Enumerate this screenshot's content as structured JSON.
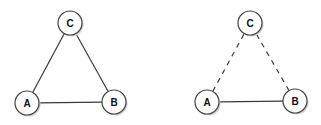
{
  "graphs": [
    {
      "name": "complete-triangle",
      "nodes": [
        {
          "id": "A",
          "label": "A"
        },
        {
          "id": "B",
          "label": "B"
        },
        {
          "id": "C",
          "label": "C"
        }
      ],
      "edges": [
        {
          "from": "A",
          "to": "B",
          "style": "solid"
        },
        {
          "from": "A",
          "to": "C",
          "style": "solid"
        },
        {
          "from": "B",
          "to": "C",
          "style": "solid"
        }
      ]
    },
    {
      "name": "partial-triangle",
      "nodes": [
        {
          "id": "A",
          "label": "A"
        },
        {
          "id": "B",
          "label": "B"
        },
        {
          "id": "C",
          "label": "C"
        }
      ],
      "edges": [
        {
          "from": "A",
          "to": "B",
          "style": "solid"
        },
        {
          "from": "A",
          "to": "C",
          "style": "dashed"
        },
        {
          "from": "B",
          "to": "C",
          "style": "dashed"
        }
      ]
    }
  ]
}
